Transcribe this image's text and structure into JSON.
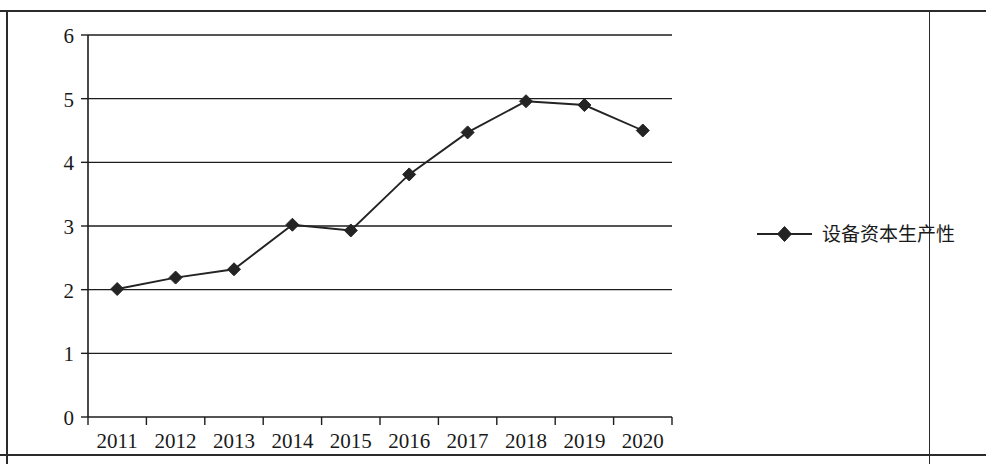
{
  "chart_data": {
    "type": "line",
    "title": "",
    "subtitle": "",
    "xlabel": "",
    "ylabel": "",
    "categories": [
      "2011",
      "2012",
      "2013",
      "2014",
      "2015",
      "2016",
      "2017",
      "2018",
      "2019",
      "2020"
    ],
    "series": [
      {
        "name": "设备资本生产性",
        "values": [
          2.01,
          2.19,
          2.32,
          3.02,
          2.93,
          3.81,
          4.47,
          4.96,
          4.9,
          4.5
        ],
        "marker": "diamond",
        "color": "#232323"
      }
    ],
    "ylim": [
      0,
      6
    ],
    "yticks": [
      0,
      1,
      2,
      3,
      4,
      5,
      6
    ],
    "ytick_labels": [
      "0",
      "1",
      "2",
      "3",
      "4",
      "5",
      "6"
    ],
    "grid": true,
    "grid_axis": "y",
    "legend_position": "right",
    "legend_entries": [
      "设备资本生产性"
    ]
  },
  "legend": {
    "items": [
      {
        "label": "设备资本生产性",
        "marker": "diamond-marker-icon"
      }
    ]
  }
}
